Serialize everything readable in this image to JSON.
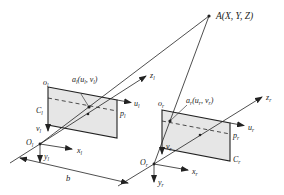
{
  "diagram": {
    "type": "stereo-camera-geometry",
    "point": {
      "label": "A(X, Y, Z)"
    },
    "left_camera": {
      "origin": "O",
      "origin_sub": "l",
      "image_origin": "o",
      "image_origin_sub": "l",
      "image_point": "a",
      "image_point_sub": "l",
      "image_point_coords": "(u",
      "image_point_coords_mid": ", v",
      "image_point_coords_end": ")",
      "axis_u": "u",
      "axis_v": "v",
      "axis_x": "x",
      "axis_y": "y",
      "axis_z": "z",
      "sub": "l",
      "plane_label_C": "C",
      "plane_label_p": "p"
    },
    "right_camera": {
      "origin": "O",
      "origin_sub": "r",
      "image_origin": "o",
      "image_origin_sub": "r",
      "image_point": "a",
      "image_point_sub": "r",
      "image_point_coords": "(u",
      "image_point_coords_mid": ", v",
      "image_point_coords_end": ")",
      "axis_u": "u",
      "axis_v": "v",
      "axis_x": "x",
      "axis_y": "y",
      "axis_z": "z",
      "sub": "r",
      "plane_label_C": "C",
      "plane_label_p": "p"
    },
    "baseline": {
      "label": "b"
    },
    "colors": {
      "line": "#222222",
      "plane_fill": "#e6e6e6"
    }
  }
}
